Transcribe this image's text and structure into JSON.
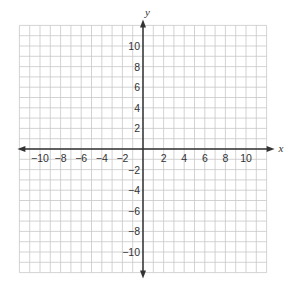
{
  "diagram": {
    "type": "coordinate-plane",
    "axes": {
      "x_label": "x",
      "y_label": "y"
    },
    "x_range": [
      -12,
      12
    ],
    "y_range": [
      -12,
      12
    ],
    "grid_step": 1,
    "x_tick_labels": [
      "−10",
      "−8",
      "−6",
      "−4",
      "−2",
      "2",
      "4",
      "6",
      "8",
      "10"
    ],
    "x_tick_values": [
      -10,
      -8,
      -6,
      -4,
      -2,
      2,
      4,
      6,
      8,
      10
    ],
    "y_tick_labels": [
      "10",
      "8",
      "6",
      "4",
      "2",
      "−2",
      "−4",
      "−6",
      "−8",
      "−10"
    ],
    "y_tick_values": [
      10,
      8,
      6,
      4,
      2,
      -2,
      -4,
      -6,
      -8,
      -10
    ],
    "colors": {
      "grid": "#c8c8c8",
      "axis": "#333333",
      "text": "#333333"
    }
  }
}
